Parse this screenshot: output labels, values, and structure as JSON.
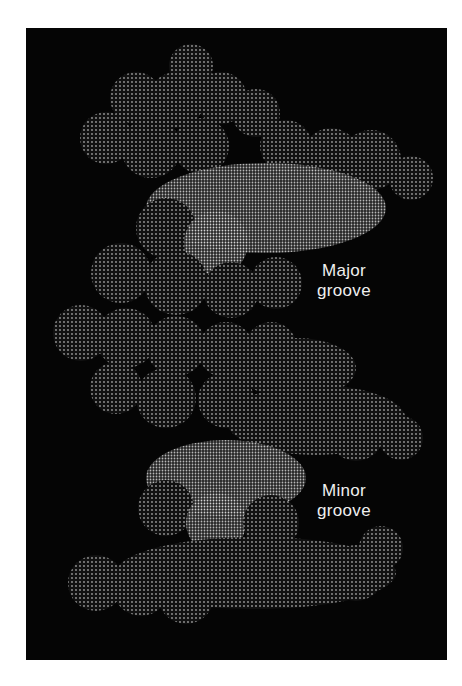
{
  "figure": {
    "background_color": "#050505",
    "surface_color": "#bdbdbd",
    "labels": {
      "major_groove": {
        "line1": "Major",
        "line2": "groove"
      },
      "minor_groove": {
        "line1": "Minor",
        "line2": "groove"
      }
    }
  }
}
